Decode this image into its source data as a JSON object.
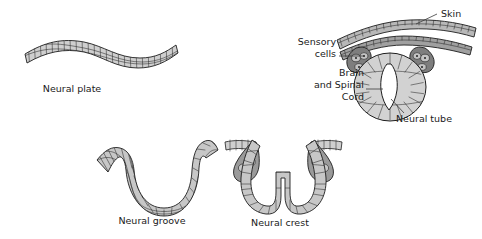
{
  "figure": {
    "background_color": "#ffffff",
    "ink_color": "#1e1e1e",
    "tissue_light": "#d9d9d9",
    "tissue_mid": "#bfbfbf",
    "tissue_dark": "#8c8c8c",
    "tissue_darker": "#6e6e6e"
  },
  "panels": [
    {
      "id": "neural-plate",
      "label": "Neural plate",
      "label_x": 72,
      "label_y": 92,
      "description": "Wavy flat sheet of columnar epithelial cells"
    },
    {
      "id": "neural-groove",
      "label": "Neural groove",
      "label_x": 152,
      "label_y": 224,
      "description": "Sheet invaginated into a U-shaped groove"
    },
    {
      "id": "neural-crest",
      "label": "Neural crest",
      "label_x": 280,
      "label_y": 226,
      "description": "Deep folded tube with paired lateral crest lobes"
    },
    {
      "id": "neural-tube",
      "label": "Neural tube",
      "label_x": 424,
      "label_y": 122,
      "description": "Closed oval tube beneath skin with sensory cell ganglia"
    }
  ],
  "callouts": [
    {
      "id": "skin",
      "label": "Skin",
      "label_x": 441,
      "label_y": 17,
      "anchor": "start",
      "leader": "M 437 14 L 416 24"
    },
    {
      "id": "sensory-cells",
      "label_lines": [
        "Sensory",
        "cells"
      ],
      "label_x": 336,
      "label_y": 45,
      "anchor": "end",
      "leader": "M 339 56 L 362 56"
    },
    {
      "id": "brain-and-spinal-cord",
      "label_lines": [
        "Brain",
        "and Spinal",
        "Cord"
      ],
      "label_x": 364,
      "label_y": 76,
      "anchor": "end",
      "leader": "M 366 89 L 382 89"
    },
    {
      "id": "neural-tube-pointer",
      "leader": "M 400 112 L 390 98"
    }
  ]
}
